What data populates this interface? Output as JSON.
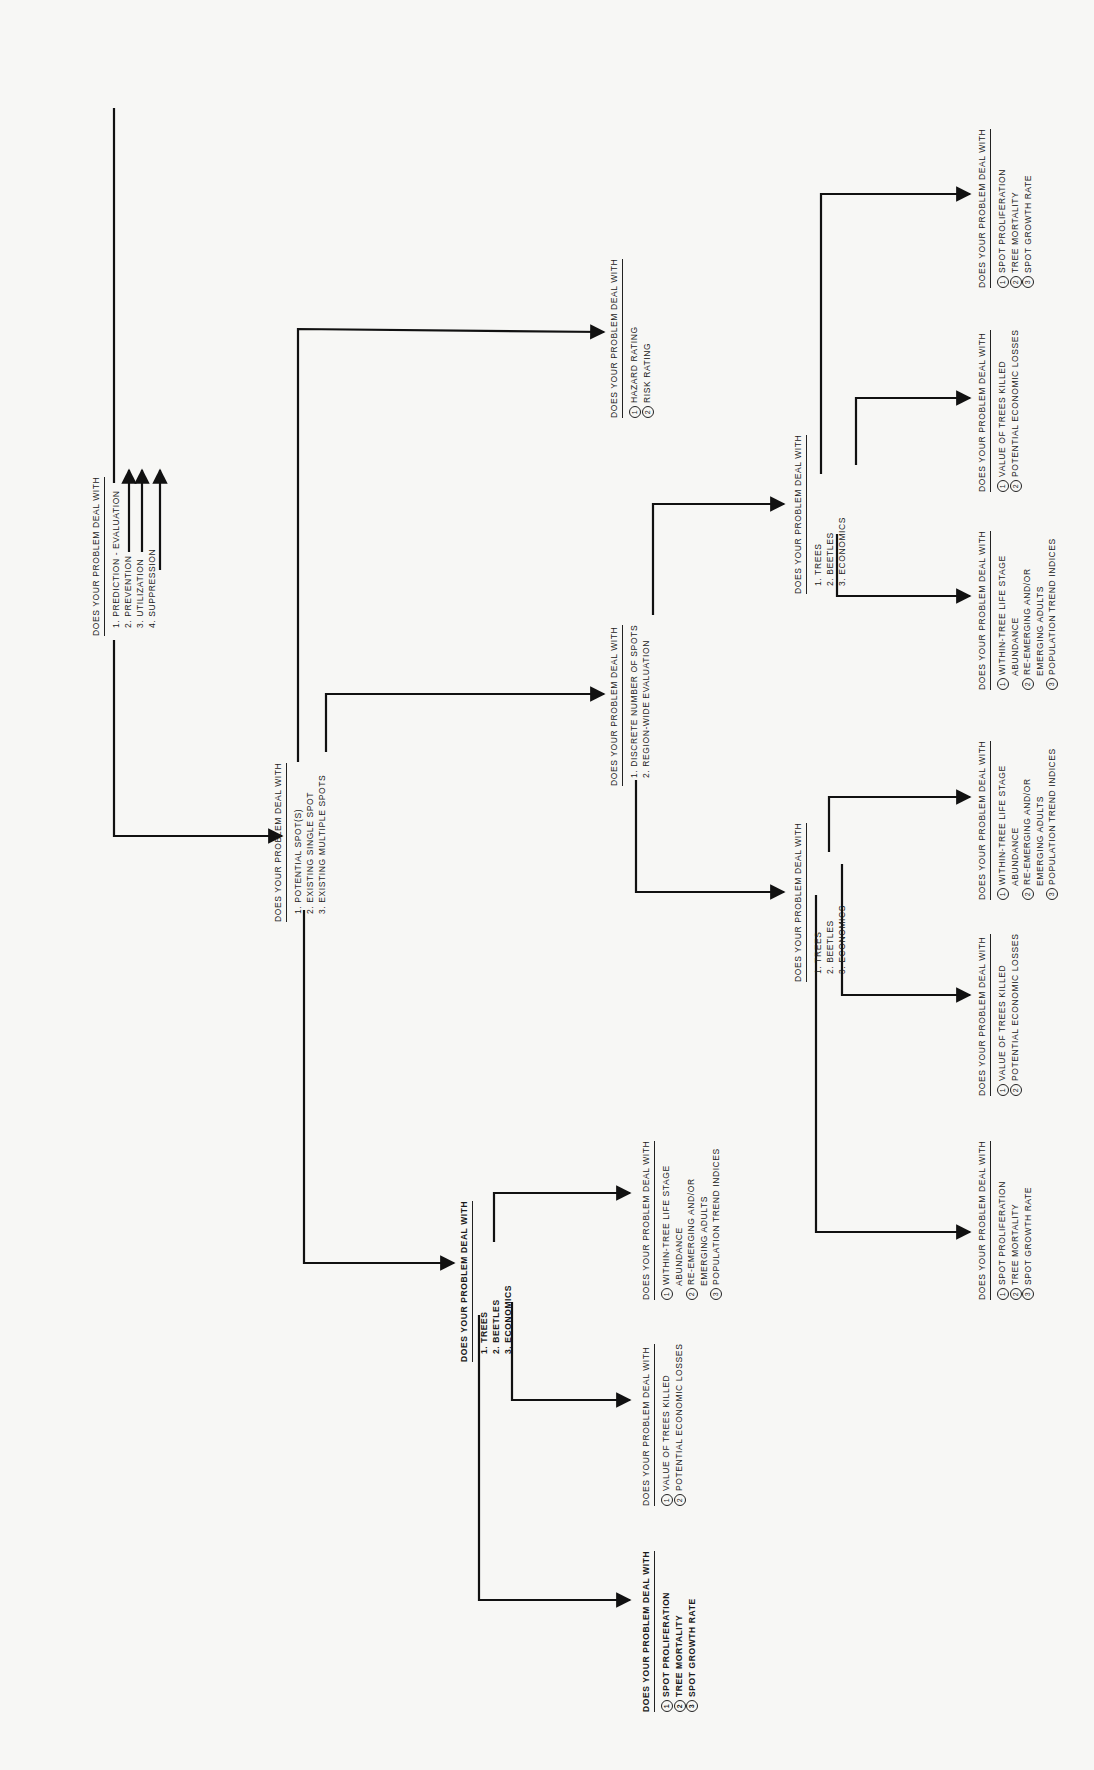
{
  "diagram": {
    "question": "DOES YOUR PROBLEM DEAL WITH",
    "nodes": {
      "root": {
        "question": "DOES YOUR PROBLEM DEAL WITH",
        "options": [
          "1. PREDICTION - EVALUATION",
          "2. PREVENTION",
          "3. UTILIZATION",
          "4. SUPPRESSION"
        ]
      },
      "spots": {
        "question": "DOES YOUR PROBLEM DEAL WITH",
        "options": [
          "1. POTENTIAL SPOT(S)",
          "2. EXISTING SINGLE SPOT",
          "3. EXISTING MULTIPLE SPOTS"
        ]
      },
      "rating": {
        "question": "DOES YOUR PROBLEM DEAL WITH",
        "options": [
          {
            "num": "1",
            "label": "HAZARD RATING"
          },
          {
            "num": "2",
            "label": "RISK RATING"
          }
        ]
      },
      "multiple": {
        "question": "DOES YOUR PROBLEM DEAL WITH",
        "options": [
          "1. DISCRETE NUMBER OF SPOTS",
          "2. REGION-WIDE EVALUATION"
        ]
      },
      "tbe_region": {
        "question": "DOES YOUR PROBLEM DEAL WITH",
        "options": [
          "1. TREES",
          "2. BEETLES",
          "3. ECONOMICS"
        ]
      },
      "tbe_discrete": {
        "question": "DOES YOUR PROBLEM DEAL WITH",
        "options": [
          "1. TREES",
          "2. BEETLES",
          "3. ECONOMICS"
        ]
      },
      "tbe_single": {
        "question": "DOES YOUR PROBLEM DEAL WITH",
        "options": [
          "1. TREES",
          "2. BEETLES",
          "3. ECONOMICS"
        ]
      },
      "trees_leaf": {
        "question": "DOES YOUR PROBLEM DEAL WITH",
        "options": [
          {
            "num": "1",
            "label": "SPOT PROLIFERATION"
          },
          {
            "num": "2",
            "label": "TREE MORTALITY"
          },
          {
            "num": "3",
            "label": "SPOT GROWTH RATE"
          }
        ]
      },
      "econ_leaf": {
        "question": "DOES YOUR PROBLEM DEAL WITH",
        "options": [
          {
            "num": "1",
            "label": "VALUE OF TREES KILLED"
          },
          {
            "num": "2",
            "label": "POTENTIAL ECONOMIC LOSSES"
          }
        ]
      },
      "beetle_leaf": {
        "question": "DOES YOUR PROBLEM DEAL WITH",
        "options": [
          {
            "num": "1",
            "label": "WITHIN-TREE LIFE STAGE",
            "sub": "ABUNDANCE"
          },
          {
            "num": "2",
            "label": "RE-EMERGING AND/OR",
            "sub": "EMERGING ADULTS"
          },
          {
            "num": "3",
            "label": "POPULATION TREND INDICES"
          }
        ]
      }
    }
  }
}
